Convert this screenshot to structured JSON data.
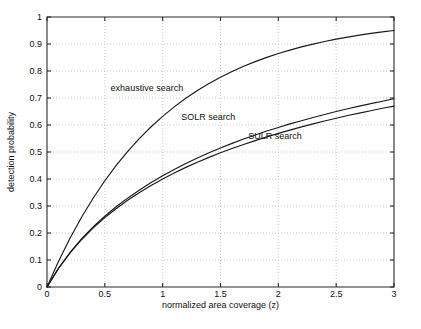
{
  "chart_data": {
    "type": "line",
    "title": "",
    "xlabel": "normalized area coverage (z)",
    "ylabel": "detection probability",
    "xlim": [
      0,
      3
    ],
    "ylim": [
      0,
      1
    ],
    "xticks": [
      0,
      0.5,
      1,
      1.5,
      2,
      2.5,
      3
    ],
    "xticklabels": [
      "0",
      "0.5",
      "1",
      "1.5",
      "2",
      "2.5",
      "3"
    ],
    "yticks": [
      0,
      0.1,
      0.2,
      0.3,
      0.4,
      0.5,
      0.6,
      0.7,
      0.8,
      0.9,
      1
    ],
    "yticklabels": [
      "0",
      "0.1",
      "0.2",
      "0.3",
      "0.4",
      "0.5",
      "0.6",
      "0.7",
      "0.8",
      "0.9",
      "1"
    ],
    "grid": true,
    "legend_position": "inline-annotations",
    "line_color": "#1a1a1a",
    "x": [
      0,
      0.1,
      0.2,
      0.3,
      0.4,
      0.5,
      0.6,
      0.7,
      0.8,
      0.9,
      1.0,
      1.1,
      1.2,
      1.3,
      1.4,
      1.5,
      1.6,
      1.7,
      1.8,
      1.9,
      2.0,
      2.1,
      2.2,
      2.3,
      2.4,
      2.5,
      2.6,
      2.7,
      2.8,
      2.9,
      3.0
    ],
    "series": [
      {
        "name": "exhaustive search",
        "label": "exhaustive search",
        "label_x": 0.55,
        "label_y": 0.725,
        "values": [
          0.0,
          0.0952,
          0.1813,
          0.2592,
          0.3297,
          0.3935,
          0.4512,
          0.5034,
          0.5507,
          0.5934,
          0.6321,
          0.6671,
          0.6988,
          0.7275,
          0.7534,
          0.7769,
          0.7981,
          0.8173,
          0.8347,
          0.8504,
          0.8647,
          0.8775,
          0.8892,
          0.8997,
          0.9093,
          0.9179,
          0.9257,
          0.9328,
          0.9392,
          0.945,
          0.9502
        ]
      },
      {
        "name": "SOLR search",
        "label": "SOLR search",
        "label_x": 1.16,
        "label_y": 0.617,
        "values": [
          0.0,
          0.07,
          0.128,
          0.179,
          0.223,
          0.262,
          0.298,
          0.33,
          0.359,
          0.387,
          0.412,
          0.435,
          0.457,
          0.478,
          0.497,
          0.515,
          0.532,
          0.548,
          0.563,
          0.578,
          0.591,
          0.604,
          0.616,
          0.628,
          0.639,
          0.65,
          0.66,
          0.67,
          0.679,
          0.688,
          0.697
        ]
      },
      {
        "name": "SULR search",
        "label": "SULR search",
        "label_x": 1.74,
        "label_y": 0.548,
        "values": [
          0.0,
          0.069,
          0.126,
          0.176,
          0.219,
          0.257,
          0.291,
          0.322,
          0.35,
          0.376,
          0.4,
          0.422,
          0.443,
          0.462,
          0.48,
          0.497,
          0.513,
          0.528,
          0.542,
          0.556,
          0.569,
          0.581,
          0.593,
          0.604,
          0.615,
          0.625,
          0.635,
          0.644,
          0.653,
          0.662,
          0.67
        ]
      }
    ]
  }
}
